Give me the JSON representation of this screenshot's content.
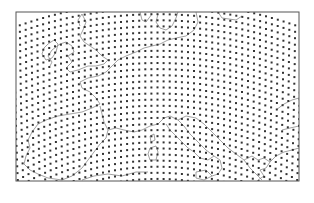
{
  "map": {
    "type": "grid-point map",
    "projection": "conic (curved grid lines)",
    "region": "Europe",
    "frame": {
      "x": 16,
      "y": 12,
      "width": 283,
      "height": 169
    },
    "colors": {
      "background": "#ffffff",
      "frame": "#555555",
      "grid_points": "#333333",
      "coastlines": "#8a8a8a"
    },
    "grid": {
      "spacing_px": 6.1,
      "point_size_px": 2,
      "curvature": 0.0011,
      "rotation_deg_left": -12,
      "rotation_deg_right": 14
    },
    "features": [
      "British Isles",
      "North Sea",
      "Scandinavia (south)",
      "Baltic Sea",
      "France",
      "Iberian Peninsula",
      "Italy",
      "Adriatic Sea",
      "Balkans",
      "Greece",
      "Mediterranean Sea",
      "Black Sea"
    ]
  }
}
